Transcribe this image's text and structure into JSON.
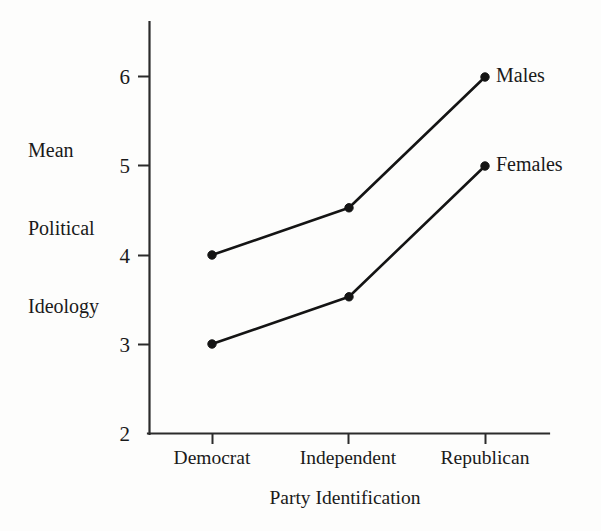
{
  "chart_data": {
    "type": "line",
    "title": "",
    "xlabel": "Party Identification",
    "ylabel": "Mean Political Ideology",
    "ylabel_lines": [
      "Mean",
      "Political",
      "Ideology"
    ],
    "categories": [
      "Democrat",
      "Independent",
      "Republican"
    ],
    "ylim": [
      2,
      6.4
    ],
    "yticks": [
      2,
      3,
      4,
      5,
      6
    ],
    "ytick_labels": [
      "2",
      "3",
      "4",
      "5",
      "6"
    ],
    "grid": false,
    "legend_position": "right-of-endpoints",
    "marker": "filled-circle",
    "line_color": "#141414",
    "axis_color": "#2b2b2b",
    "background_color": "#fdfdfc",
    "series": [
      {
        "name": "Males",
        "values": [
          4.0,
          4.53,
          6.0
        ],
        "label_text": "Males"
      },
      {
        "name": "Females",
        "values": [
          3.0,
          3.53,
          5.0
        ],
        "label_text": "Females"
      }
    ]
  },
  "labels": {
    "ytick_2": "2",
    "ytick_3": "3",
    "ytick_4": "4",
    "ytick_5": "5",
    "ytick_6": "6",
    "xtick_democrat": "Democrat",
    "xtick_independent": "Independent",
    "xtick_republican": "Republican",
    "ylabel_line1": "Mean",
    "ylabel_line2": "Political",
    "ylabel_line3": "Ideology",
    "xlabel": "Party Identification",
    "series_males": "Males",
    "series_females": "Females"
  }
}
